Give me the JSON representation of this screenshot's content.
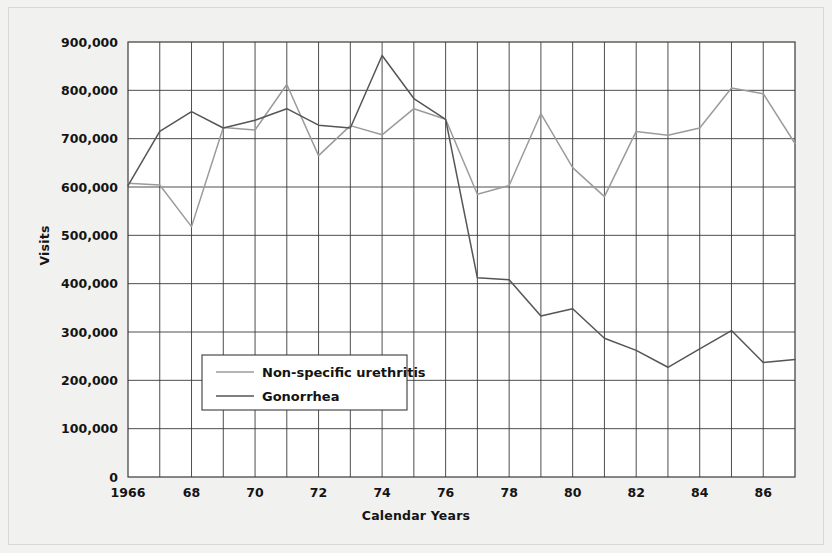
{
  "figure": {
    "background_color": "#f1f1ef",
    "plot_background_color": "#ffffff",
    "border_color": "#d8d8d6"
  },
  "chart_data": {
    "type": "line",
    "title": "",
    "xlabel": "Calendar Years",
    "ylabel": "Visits",
    "xlim": [
      1966,
      1987
    ],
    "ylim": [
      0,
      900000
    ],
    "grid": true,
    "legend_position": "center-left",
    "y_ticks": [
      0,
      100000,
      200000,
      300000,
      400000,
      500000,
      600000,
      700000,
      800000,
      900000
    ],
    "y_tick_labels": [
      "0",
      "100,000",
      "200,000",
      "300,000",
      "400,000",
      "500,000",
      "600,000",
      "700,000",
      "800,000",
      "900,000"
    ],
    "x_ticks": [
      1966,
      1968,
      1970,
      1972,
      1974,
      1976,
      1978,
      1980,
      1982,
      1984,
      1986
    ],
    "x_tick_labels": [
      "1966",
      "68",
      "70",
      "72",
      "74",
      "76",
      "78",
      "80",
      "82",
      "84",
      "86"
    ],
    "x": [
      1966,
      1967,
      1968,
      1969,
      1970,
      1971,
      1972,
      1973,
      1974,
      1975,
      1976,
      1977,
      1978,
      1979,
      1980,
      1981,
      1982,
      1983,
      1984,
      1985,
      1986,
      1987
    ],
    "series": [
      {
        "name": "Non-specific urethritis",
        "color": "#9b9b9b",
        "values": [
          608000,
          604000,
          518000,
          723000,
          718000,
          812000,
          665000,
          727000,
          708000,
          762000,
          740000,
          585000,
          603000,
          752000,
          640000,
          580000,
          715000,
          707000,
          722000,
          805000,
          793000,
          690000
        ]
      },
      {
        "name": "Gonorrhea",
        "color": "#555555",
        "values": [
          603000,
          715000,
          756000,
          722000,
          738000,
          762000,
          728000,
          722000,
          872000,
          783000,
          740000,
          412000,
          408000,
          333000,
          348000,
          287000,
          262000,
          227000,
          265000,
          303000,
          237000,
          243000
        ]
      }
    ]
  },
  "legend": {
    "items": [
      {
        "label": "Non-specific urethritis",
        "color": "#9b9b9b"
      },
      {
        "label": "Gonorrhea",
        "color": "#555555"
      }
    ]
  }
}
